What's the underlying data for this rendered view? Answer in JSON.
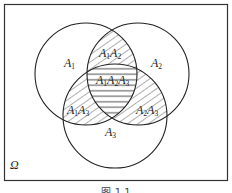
{
  "diagram": {
    "type": "venn",
    "universe_label": "Ω",
    "sets": [
      {
        "id": "A1",
        "label": "A",
        "sub": "1"
      },
      {
        "id": "A2",
        "label": "A",
        "sub": "2"
      },
      {
        "id": "A3",
        "label": "A",
        "sub": "3"
      }
    ],
    "regions": [
      {
        "id": "A1A2",
        "parts": [
          "1",
          "2"
        ],
        "hatch": "diagonal"
      },
      {
        "id": "A1A2A3",
        "parts": [
          "1",
          "2",
          "3"
        ],
        "hatch": "horizontal"
      },
      {
        "id": "A1A3",
        "parts": [
          "1",
          "3"
        ],
        "hatch": "diagonal"
      },
      {
        "id": "A2A3",
        "parts": [
          "2",
          "3"
        ],
        "hatch": "diagonal"
      }
    ],
    "caption": "图 1.1"
  }
}
